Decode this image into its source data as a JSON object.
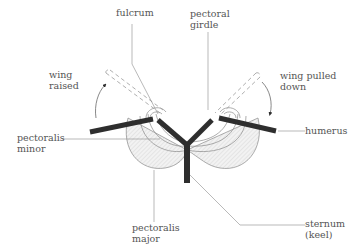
{
  "labels": {
    "fulcrum": "fulcrum",
    "pectoral_girdle_1": "pectoral",
    "pectoral_girdle_2": "girdle",
    "wing_raised_1": "wing",
    "wing_raised_2": "raised",
    "wing_pulled_down_1": "wing pulled",
    "wing_pulled_down_2": "down",
    "pectoralis_minor_1": "pectoralis",
    "pectoralis_minor_2": "minor",
    "humerus": "humerus",
    "pectoralis_major_1": "pectoralis",
    "pectoralis_major_2": "major",
    "sternum_1": "sternum",
    "sternum_2": "(keel)"
  },
  "colors": {
    "bone": "#2e2e2e",
    "line": "#8a8a8a",
    "muscle_fill": "#ececec",
    "text": "#555555"
  }
}
